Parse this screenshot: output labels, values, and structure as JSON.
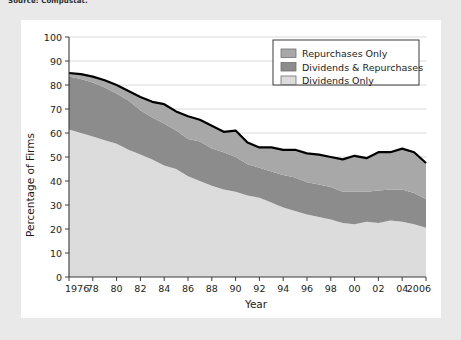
{
  "source_note": "Source: Compustat.",
  "figure": {
    "background_color": "#ffffff",
    "page_background": "#e9e9e9"
  },
  "chart_data": {
    "type": "area",
    "stacked": true,
    "title": "",
    "subtitle": "",
    "xlabel": "Year",
    "ylabel": "Percentage of Firms",
    "xlim": [
      1976,
      2006
    ],
    "ylim": [
      0,
      100
    ],
    "grid": true,
    "grid_axis": "y",
    "legend_position": "top-right",
    "x": [
      1976,
      1977,
      1978,
      1979,
      1980,
      1981,
      1982,
      1983,
      1984,
      1985,
      1986,
      1987,
      1988,
      1989,
      1990,
      1991,
      1992,
      1993,
      1994,
      1995,
      1996,
      1997,
      1998,
      1999,
      2000,
      2001,
      2002,
      2003,
      2004,
      2005,
      2006
    ],
    "xtick_values": [
      1976,
      1978,
      1980,
      1982,
      1984,
      1986,
      1988,
      1990,
      1992,
      1994,
      1996,
      1998,
      2000,
      2002,
      2004,
      2006
    ],
    "xtick_labels": [
      "1976",
      "78",
      "80",
      "82",
      "84",
      "86",
      "88",
      "90",
      "92",
      "94",
      "96",
      "98",
      "00",
      "02",
      "04",
      "2006"
    ],
    "ytick_values": [
      0,
      10,
      20,
      30,
      40,
      50,
      60,
      70,
      80,
      90,
      100
    ],
    "ytick_labels": [
      "0",
      "10",
      "20",
      "30",
      "40",
      "50",
      "60",
      "70",
      "80",
      "90",
      "100"
    ],
    "series": [
      {
        "name": "Dividends Only",
        "color": "#dcdcdc",
        "order": 1,
        "values": [
          61.5,
          60.0,
          58.5,
          57.0,
          55.5,
          53.0,
          51.0,
          49.0,
          46.5,
          45.0,
          42.0,
          40.0,
          38.0,
          36.5,
          35.5,
          34.0,
          33.0,
          31.0,
          29.0,
          27.5,
          26.0,
          25.0,
          24.0,
          22.5,
          22.0,
          23.0,
          22.5,
          23.5,
          23.0,
          22.0,
          20.5
        ]
      },
      {
        "name": "Dividends & Repurchases",
        "color": "#8c8c8c",
        "order": 2,
        "values": [
          22.0,
          22.5,
          22.5,
          22.0,
          21.0,
          20.5,
          18.5,
          17.5,
          17.5,
          16.0,
          15.5,
          16.5,
          15.5,
          15.5,
          14.5,
          13.0,
          12.5,
          13.0,
          13.5,
          14.0,
          13.5,
          13.5,
          13.5,
          13.0,
          13.5,
          12.5,
          13.5,
          13.0,
          13.5,
          13.0,
          12.0
        ]
      },
      {
        "name": "Repurchases Only",
        "color": "#a8a8a8",
        "order": 3,
        "values": [
          1.5,
          2.0,
          2.5,
          3.0,
          3.5,
          4.0,
          5.5,
          6.5,
          8.0,
          8.0,
          9.5,
          9.0,
          9.5,
          8.5,
          11.0,
          9.0,
          8.5,
          10.0,
          10.5,
          11.5,
          12.0,
          12.5,
          12.5,
          13.5,
          15.0,
          14.0,
          16.0,
          15.5,
          17.0,
          17.0,
          15.0
        ]
      }
    ],
    "total_line": {
      "name": "Total Payout",
      "color": "#000000",
      "values": [
        85.0,
        84.5,
        83.5,
        82.0,
        80.0,
        77.5,
        75.0,
        73.0,
        72.0,
        69.0,
        67.0,
        65.5,
        63.0,
        60.5,
        61.0,
        56.0,
        54.0,
        54.0,
        53.0,
        53.0,
        51.5,
        51.0,
        50.0,
        49.0,
        50.5,
        49.5,
        52.0,
        52.0,
        53.5,
        52.0,
        47.5
      ]
    },
    "legend_entries": [
      {
        "label": "Repurchases Only",
        "color": "#a8a8a8"
      },
      {
        "label": "Dividends & Repurchases",
        "color": "#8c8c8c"
      },
      {
        "label": "Dividends Only",
        "color": "#dcdcdc"
      }
    ]
  }
}
